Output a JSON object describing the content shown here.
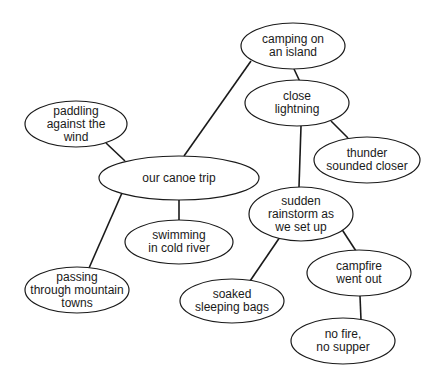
{
  "diagram": {
    "type": "cluster map",
    "line_color": "#1a1a1a",
    "nodes": [
      {
        "id": "center",
        "lines": [
          "our canoe trip"
        ],
        "cx": 179,
        "cy": 178,
        "rx": 80,
        "ry": 22
      },
      {
        "id": "island",
        "lines": [
          "camping on",
          "an island"
        ],
        "cx": 293,
        "cy": 46,
        "rx": 52,
        "ry": 23
      },
      {
        "id": "lightning",
        "lines": [
          "close",
          "lightning"
        ],
        "cx": 297,
        "cy": 103,
        "rx": 52,
        "ry": 23
      },
      {
        "id": "thunder",
        "lines": [
          "thunder",
          "sounded closer"
        ],
        "cx": 367,
        "cy": 160,
        "rx": 53,
        "ry": 23
      },
      {
        "id": "paddling",
        "lines": [
          "paddling",
          "against the",
          "wind"
        ],
        "cx": 76,
        "cy": 124,
        "rx": 51,
        "ry": 23
      },
      {
        "id": "swimming",
        "lines": [
          "swimming",
          "in cold river"
        ],
        "cx": 179,
        "cy": 242,
        "rx": 54,
        "ry": 22
      },
      {
        "id": "rainstorm",
        "lines": [
          "sudden",
          "rainstorm as",
          "we set up"
        ],
        "cx": 301,
        "cy": 214,
        "rx": 52,
        "ry": 27
      },
      {
        "id": "passing",
        "lines": [
          "passing",
          "through mountain",
          "towns"
        ],
        "cx": 77,
        "cy": 290,
        "rx": 52,
        "ry": 23
      },
      {
        "id": "soaked",
        "lines": [
          "soaked",
          "sleeping bags"
        ],
        "cx": 232,
        "cy": 301,
        "rx": 52,
        "ry": 22
      },
      {
        "id": "campfire",
        "lines": [
          "campfire",
          "went out"
        ],
        "cx": 359,
        "cy": 273,
        "rx": 52,
        "ry": 23
      },
      {
        "id": "nofire",
        "lines": [
          "no fire,",
          "no supper"
        ],
        "cx": 343,
        "cy": 341,
        "rx": 52,
        "ry": 23
      }
    ],
    "edges": [
      {
        "from": "center",
        "to": "island",
        "x1": 184,
        "y1": 156,
        "x2": 251,
        "y2": 61
      },
      {
        "from": "center",
        "to": "paddling",
        "x1": 125,
        "y1": 161,
        "x2": 106,
        "y2": 143
      },
      {
        "from": "center",
        "to": "swimming",
        "x1": 179,
        "y1": 200,
        "x2": 179,
        "y2": 220
      },
      {
        "from": "center",
        "to": "passing",
        "x1": 122,
        "y1": 193,
        "x2": 89,
        "y2": 268
      },
      {
        "from": "island",
        "to": "lightning",
        "x1": 294,
        "y1": 69,
        "x2": 302,
        "y2": 86
      },
      {
        "from": "lightning",
        "to": "thunder",
        "x1": 331,
        "y1": 121,
        "x2": 348,
        "y2": 138
      },
      {
        "from": "lightning",
        "to": "rainstorm",
        "x1": 301,
        "y1": 126,
        "x2": 299,
        "y2": 187
      },
      {
        "from": "rainstorm",
        "to": "soaked",
        "x1": 280,
        "y1": 237,
        "x2": 250,
        "y2": 281
      },
      {
        "from": "rainstorm",
        "to": "campfire",
        "x1": 341,
        "y1": 228,
        "x2": 356,
        "y2": 251
      },
      {
        "from": "campfire",
        "to": "nofire",
        "x1": 360,
        "y1": 296,
        "x2": 361,
        "y2": 320
      }
    ]
  }
}
